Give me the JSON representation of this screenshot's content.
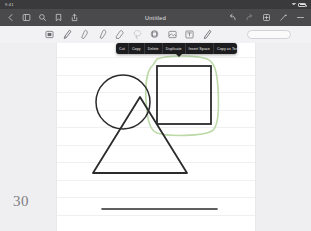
{
  "status_bar": {
    "time": "9:41",
    "wifi_icon": "wifi-icon",
    "battery_icon": "battery-icon"
  },
  "nav_bar": {
    "title": "Untitled",
    "left_icons": [
      {
        "name": "back-chevron-icon",
        "label": "Back"
      },
      {
        "name": "sidebar-toggle-icon",
        "label": "Pages"
      },
      {
        "name": "search-icon",
        "label": "Search"
      },
      {
        "name": "bookmark-icon",
        "label": "Bookmark"
      },
      {
        "name": "share-icon",
        "label": "Share"
      }
    ],
    "right_icons": [
      {
        "name": "undo-icon",
        "label": "Undo"
      },
      {
        "name": "redo-icon",
        "label": "Redo"
      },
      {
        "name": "add-page-icon",
        "label": "Add"
      },
      {
        "name": "magic-wand-icon",
        "label": "Markup"
      },
      {
        "name": "more-options-icon",
        "label": "More"
      }
    ]
  },
  "tool_palette": {
    "tools": [
      {
        "name": "selection-tool",
        "label": "Select"
      },
      {
        "name": "pen-tool",
        "label": "Pen"
      },
      {
        "name": "highlighter-tool",
        "label": "Highlighter"
      },
      {
        "name": "marker-tool",
        "label": "Marker"
      },
      {
        "name": "eraser-tool",
        "label": "Eraser"
      },
      {
        "name": "lasso-tool",
        "label": "Lasso"
      },
      {
        "name": "shape-tool",
        "label": "Shapes"
      },
      {
        "name": "image-tool",
        "label": "Image"
      },
      {
        "name": "text-tool",
        "label": "Text"
      },
      {
        "name": "laser-pointer-tool",
        "label": "Laser"
      }
    ],
    "color_pill_label": ""
  },
  "context_menu": {
    "items": [
      {
        "name": "menu-item-cut",
        "label": "Cut"
      },
      {
        "name": "menu-item-copy",
        "label": "Copy"
      },
      {
        "name": "menu-item-delete",
        "label": "Delete"
      },
      {
        "name": "menu-item-duplicate",
        "label": "Duplicate"
      },
      {
        "name": "menu-item-insert-space",
        "label": "Insert Space"
      },
      {
        "name": "menu-item-copy-as-text",
        "label": "Copy as Text"
      },
      {
        "name": "menu-item-more",
        "label": "›"
      }
    ]
  },
  "canvas": {
    "page_number": "30",
    "selection_color": "#bcd9a8",
    "ink_color": "#2b2b2d",
    "rule_color": "#f0f0f2",
    "shapes": [
      {
        "name": "circle-shape",
        "type": "circle",
        "cx": 66,
        "cy": 59,
        "r": 27,
        "selected": false
      },
      {
        "name": "square-shape",
        "type": "rect",
        "x": 100,
        "y": 23,
        "width": 54,
        "height": 58,
        "selected": true
      },
      {
        "name": "triangle-shape",
        "type": "triangle",
        "points": "83,54 130,130 36,130",
        "selected": false
      },
      {
        "name": "line-stroke",
        "type": "line",
        "x1": 45,
        "y1": 166,
        "x2": 160,
        "y2": 166,
        "selected": false
      }
    ],
    "lasso_path": "M 96 22 C 90 27 88 42 89 58 C 90 74 92 87 100 90 C 112 94 146 93 155 88 C 162 84 162 62 161 45 C 160 30 158 19 150 16 C 140 12 110 12 100 16 Z"
  }
}
